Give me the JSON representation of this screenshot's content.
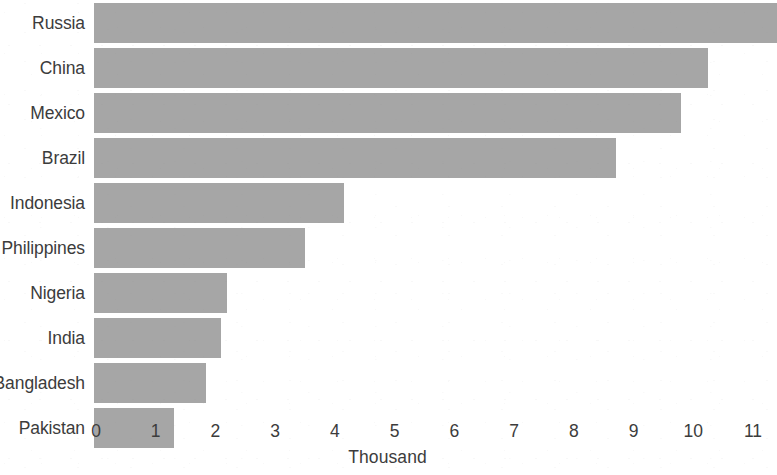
{
  "chart_data": {
    "type": "bar",
    "orientation": "horizontal",
    "title": "",
    "subtitle": "",
    "xlabel": "Thousand",
    "ylabel": "",
    "categories": [
      "Russia",
      "China",
      "Mexico",
      "Brazil",
      "Indonesia",
      "Philippines",
      "Nigeria",
      "India",
      "Bangladesh",
      "Pakistan"
    ],
    "values": [
      11.4,
      10.25,
      9.8,
      8.7,
      4.15,
      3.5,
      2.2,
      2.1,
      1.85,
      1.3
    ],
    "xlim": [
      0,
      11.4
    ],
    "xticks": [
      0,
      1,
      2,
      3,
      4,
      5,
      6,
      7,
      8,
      9,
      10,
      11
    ],
    "xtick_labels": [
      "0",
      "1",
      "2",
      "3",
      "4",
      "5",
      "6",
      "7",
      "8",
      "9",
      "10",
      "11"
    ],
    "grid": false,
    "legend": null,
    "legend_position": "none",
    "bar_color": "#a6a6a6",
    "text_color": "#3c3c3c",
    "background_color": "#ffffff"
  }
}
